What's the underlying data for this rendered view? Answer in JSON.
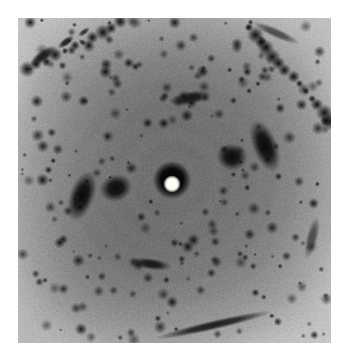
{
  "figure": {
    "kind": "x-ray-fiber-diffraction-pattern",
    "caption": "",
    "canvas": {
      "width": 347,
      "height": 358,
      "background": "#ffffff"
    },
    "plate": {
      "x": 18,
      "y": 18,
      "width": 313,
      "height": 325,
      "base_color": "#9d9d9d"
    }
  },
  "chart_data": {
    "type": "heatmap",
    "title": "",
    "subtitle": "",
    "xlabel": "",
    "ylabel": "",
    "grid": false,
    "legend": "none",
    "colormap": "grayscale-inverted",
    "intensity_range": [
      0,
      255
    ],
    "background_levels": {
      "center_gray": "#6d6d6d",
      "mid_gray": "#8b8b8b",
      "outer_gray": "#b0b0b0",
      "corner_gray": "#c2c2c2",
      "spot_dark": "#0d0d0d",
      "beamstop_white": "#fdfdf4"
    },
    "beam_center": {
      "x": 172,
      "y": 180
    },
    "beamstop": {
      "shadow_radius": 13,
      "direct_beam_spot": {
        "x": 172,
        "y": 184,
        "radius": 7,
        "color": "#fdfdf4"
      }
    },
    "rings": [
      {
        "name": "ring-1",
        "radius": 34,
        "intensity": 0.1,
        "thickness": 9
      },
      {
        "name": "ring-2",
        "radius": 56,
        "intensity": 0.14,
        "thickness": 11
      },
      {
        "name": "ring-3",
        "radius": 75,
        "intensity": 0.2,
        "thickness": 13
      },
      {
        "name": "ring-4",
        "radius": 96,
        "intensity": 0.26,
        "thickness": 15
      },
      {
        "name": "ring-5",
        "radius": 118,
        "intensity": 0.22,
        "thickness": 16
      },
      {
        "name": "ring-6",
        "radius": 140,
        "intensity": 0.18,
        "thickness": 17
      },
      {
        "name": "ring-7",
        "radius": 162,
        "intensity": 0.14,
        "thickness": 18
      }
    ],
    "major_reflections": [
      {
        "name": "equatorial-left-inner",
        "x": 116,
        "y": 188,
        "rx": 17,
        "ry": 14,
        "rot": -18,
        "intensity": 0.97
      },
      {
        "name": "equatorial-left-outer",
        "x": 82,
        "y": 196,
        "rx": 13,
        "ry": 27,
        "rot": 20,
        "intensity": 0.99
      },
      {
        "name": "equatorial-right-inner",
        "x": 232,
        "y": 157,
        "rx": 16,
        "ry": 14,
        "rot": 12,
        "intensity": 0.97
      },
      {
        "name": "equatorial-right-outer",
        "x": 265,
        "y": 146,
        "rx": 13,
        "ry": 28,
        "rot": -22,
        "intensity": 0.99
      },
      {
        "name": "meridional-top-arc",
        "x": 190,
        "y": 98,
        "rx": 22,
        "ry": 7,
        "rot": -10,
        "intensity": 0.9
      },
      {
        "name": "meridional-bottom-arc",
        "x": 151,
        "y": 264,
        "rx": 21,
        "ry": 6,
        "rot": 8,
        "intensity": 0.88
      },
      {
        "name": "upperleft-streak-a",
        "x": 43,
        "y": 56,
        "rx": 16,
        "ry": 6,
        "rot": -36,
        "intensity": 0.92
      },
      {
        "name": "upperleft-streak-b",
        "x": 66,
        "y": 42,
        "rx": 10,
        "ry": 4,
        "rot": -36,
        "intensity": 0.85
      },
      {
        "name": "upperleft-streak-c",
        "x": 84,
        "y": 32,
        "rx": 7,
        "ry": 3,
        "rot": -36,
        "intensity": 0.72
      },
      {
        "name": "bottom-rim-arc",
        "x": 214,
        "y": 325,
        "rx": 60,
        "ry": 5,
        "rot": -13,
        "intensity": 0.86
      },
      {
        "name": "right-edge-arc",
        "x": 312,
        "y": 238,
        "rx": 6,
        "ry": 22,
        "rot": 14,
        "intensity": 0.55
      },
      {
        "name": "top-right-arc",
        "x": 276,
        "y": 33,
        "rx": 26,
        "ry": 5,
        "rot": 24,
        "intensity": 0.6
      }
    ],
    "lattice_spot_rows": [
      {
        "name": "row-upper-right",
        "from": [
          248,
          28
        ],
        "to": [
          330,
          120
        ],
        "count": 14,
        "spacing_px": 9
      },
      {
        "name": "row-upper-left",
        "from": [
          28,
          70
        ],
        "to": [
          120,
          22
        ],
        "count": 11,
        "spacing_px": 10
      }
    ],
    "scattered_spot_count": 420
  }
}
